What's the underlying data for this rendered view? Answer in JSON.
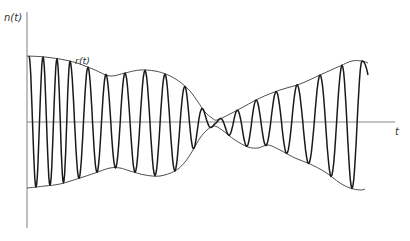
{
  "figure": {
    "y_axis_label": "n(t)",
    "x_axis_label": "t",
    "envelope_label": "r(t)",
    "colors": {
      "axis": "#8a8a8a",
      "envelope": "#3a3a3a",
      "signal": "#1a1a1a",
      "background": "#ffffff"
    },
    "axes": {
      "origin": [
        27,
        122
      ],
      "y_axis": {
        "x": 27,
        "y_top": 12,
        "y_bottom": 228
      },
      "x_axis": {
        "y": 122,
        "x_left": 27,
        "x_right": 395
      }
    },
    "upper_envelope": [
      [
        27,
        56
      ],
      [
        45,
        57
      ],
      [
        65,
        60
      ],
      [
        80,
        64
      ],
      [
        95,
        70
      ],
      [
        110,
        76
      ],
      [
        125,
        73
      ],
      [
        140,
        70
      ],
      [
        155,
        71
      ],
      [
        168,
        75
      ],
      [
        180,
        82
      ],
      [
        190,
        91
      ],
      [
        198,
        102
      ],
      [
        205,
        112
      ],
      [
        212,
        118
      ],
      [
        217,
        120
      ],
      [
        230,
        114
      ],
      [
        245,
        106
      ],
      [
        260,
        98
      ],
      [
        280,
        90
      ],
      [
        300,
        84
      ],
      [
        320,
        75
      ],
      [
        340,
        66
      ],
      [
        352,
        61
      ],
      [
        362,
        61
      ],
      [
        368,
        63
      ]
    ],
    "lower_envelope": [
      [
        27,
        188
      ],
      [
        45,
        186
      ],
      [
        60,
        184
      ],
      [
        80,
        178
      ],
      [
        95,
        173
      ],
      [
        110,
        168
      ],
      [
        120,
        168
      ],
      [
        130,
        171
      ],
      [
        145,
        175
      ],
      [
        160,
        176
      ],
      [
        175,
        171
      ],
      [
        185,
        162
      ],
      [
        193,
        150
      ],
      [
        200,
        138
      ],
      [
        207,
        130
      ],
      [
        214,
        126
      ],
      [
        222,
        130
      ],
      [
        235,
        140
      ],
      [
        248,
        147
      ],
      [
        258,
        148
      ],
      [
        268,
        145
      ],
      [
        280,
        150
      ],
      [
        295,
        158
      ],
      [
        310,
        164
      ],
      [
        325,
        172
      ],
      [
        340,
        183
      ],
      [
        350,
        188
      ],
      [
        360,
        190
      ],
      [
        365,
        189
      ]
    ],
    "carrier": {
      "peaks_x": [
        29,
        43,
        57,
        70,
        88,
        106,
        125,
        145,
        165,
        185,
        203,
        220,
        237,
        256,
        276,
        297,
        320,
        342,
        362
      ],
      "end_x": 368,
      "end_y": 75
    }
  }
}
